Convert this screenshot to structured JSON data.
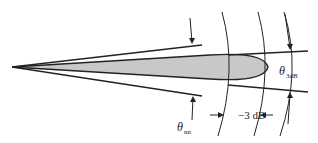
{
  "diagram": {
    "labels": {
      "theta_3db": {
        "symbol": "θ",
        "subscript": "3dB"
      },
      "theta_nn": {
        "symbol": "θ",
        "subscript": "nn"
      },
      "minus_3db": "−3 dB"
    },
    "colors": {
      "lobe_fill": "#c8c8c8",
      "line": "#222222",
      "background": "#ffffff"
    }
  }
}
